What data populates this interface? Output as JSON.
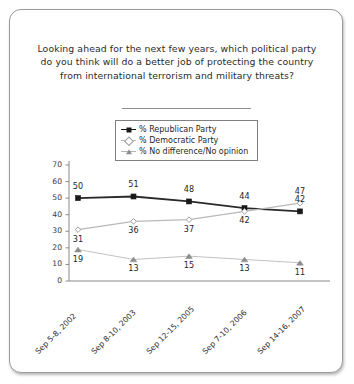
{
  "title": "Looking ahead for the next few years, which political party do you think will do a better job of protecting the country from international terrorism and military threats?",
  "legend": {
    "position": "top-center",
    "items": [
      {
        "label": "% Republican Party",
        "marker": "filled-square",
        "color": "#1a1a1a"
      },
      {
        "label": "% Democratic Party",
        "marker": "open-diamond",
        "color": "#a0a0a0"
      },
      {
        "label": "% No difference/No opinion",
        "marker": "filled-triangle",
        "color": "#8c8c8c"
      }
    ]
  },
  "chart_data": {
    "type": "line",
    "title": "Looking ahead for the next few years, which political party do you think will do a better job of protecting the country from international terrorism and military threats?",
    "xlabel": "",
    "ylabel": "",
    "ylim": [
      0,
      70
    ],
    "yticks": [
      0,
      10,
      20,
      30,
      40,
      50,
      60,
      70
    ],
    "grid": false,
    "legend_position": "top-center",
    "categories": [
      "Sep 5-8, 2002",
      "Sep 8-10, 2003",
      "Sep 12-15, 2005",
      "Sep 7-10, 2006",
      "Sep 14-16, 2007"
    ],
    "series": [
      {
        "name": "% Republican Party",
        "values": [
          50,
          51,
          48,
          44,
          42
        ]
      },
      {
        "name": "% Democratic Party",
        "values": [
          31,
          36,
          37,
          42,
          47
        ]
      },
      {
        "name": "% No difference/No opinion",
        "values": [
          19,
          13,
          15,
          13,
          11
        ]
      }
    ]
  }
}
